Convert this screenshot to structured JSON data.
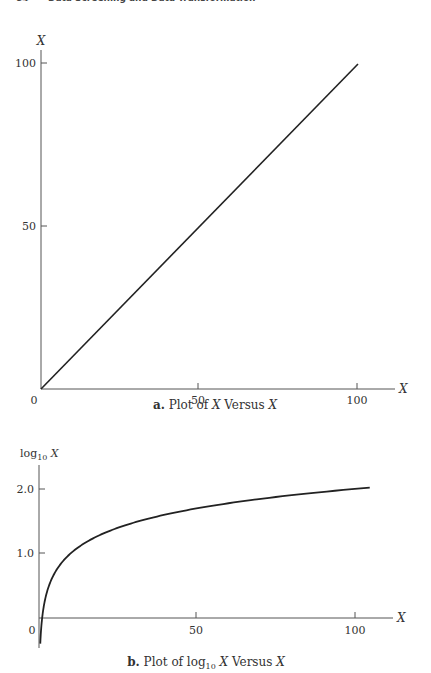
{
  "header": {
    "page_number": "84",
    "running_title": "Data Screening and Data Transformation"
  },
  "chart_data": [
    {
      "type": "line",
      "title": "a. Plot of X Versus X",
      "caption_prefix": "a.",
      "caption_text": "Plot of X Versus X",
      "xlabel": "X",
      "ylabel": "X",
      "x_ticks": [
        "0",
        "50",
        "100"
      ],
      "y_ticks": [
        "50",
        "100"
      ],
      "xlim": [
        0,
        112
      ],
      "ylim": [
        0,
        108
      ],
      "grid": false,
      "legend": null,
      "series": [
        {
          "name": "X",
          "x": [
            0,
            100
          ],
          "y": [
            0,
            100
          ]
        }
      ]
    },
    {
      "type": "line",
      "title": "b. Plot of log10 X Versus X",
      "caption_prefix": "b.",
      "caption_text": "Plot of log10 X Versus X",
      "xlabel": "X",
      "ylabel": "log10 X",
      "x_ticks": [
        "0",
        "50",
        "100"
      ],
      "y_ticks": [
        "1.0",
        "2.0"
      ],
      "xlim": [
        0,
        112
      ],
      "ylim": [
        -0.45,
        2.55
      ],
      "grid": false,
      "legend": null,
      "series": [
        {
          "name": "log10 X",
          "x": [
            0.4,
            0.6,
            1,
            1.5,
            2,
            3,
            5,
            7,
            10,
            15,
            20,
            30,
            40,
            50,
            60,
            70,
            80,
            90,
            100,
            105
          ],
          "y": [
            -0.398,
            -0.222,
            0,
            0.176,
            0.301,
            0.477,
            0.699,
            0.845,
            1.0,
            1.176,
            1.301,
            1.477,
            1.602,
            1.699,
            1.778,
            1.845,
            1.903,
            1.954,
            2.0,
            2.021
          ]
        }
      ]
    }
  ]
}
